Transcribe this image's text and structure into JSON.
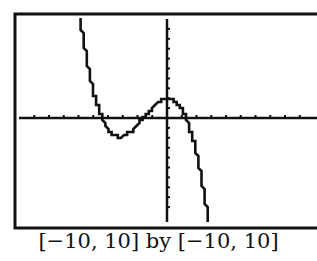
{
  "chart_data": {
    "type": "line",
    "title": "",
    "xlabel": "",
    "ylabel": "",
    "xlim": [
      -10,
      10
    ],
    "ylim": [
      -10,
      10
    ],
    "xscale_tick": 1,
    "yscale_tick": 1,
    "grid": false,
    "legend": null,
    "caption": "[−10, 10] by [−10, 10]",
    "series": [
      {
        "name": "f(x)",
        "style": "calculator-pixel",
        "x": [
          -6,
          -5.5,
          -5,
          -4.5,
          -4,
          -3.5,
          -3,
          -2.5,
          -2,
          -1.5,
          -1,
          -0.5,
          0,
          0.5,
          1,
          1.5,
          2,
          2.5,
          3
        ],
        "y": [
          11.3,
          6.42,
          2.83,
          0.37,
          -1.12,
          -1.81,
          -1.85,
          -1.43,
          -0.7,
          0.18,
          1.03,
          1.7,
          2.01,
          1.81,
          0.93,
          -0.8,
          -3.55,
          -7.47,
          -12.7
        ]
      }
    ],
    "annotations": {
      "x_intercepts_approx": [
        -4.4,
        -1.6,
        1.3
      ],
      "local_min_approx": [
        -3.2,
        -1.9
      ],
      "local_max_approx": [
        0,
        2.0
      ]
    }
  },
  "caption": "[−10, 10] by [−10, 10]",
  "colors": {
    "line": "#111111",
    "background": "#ffffff"
  }
}
